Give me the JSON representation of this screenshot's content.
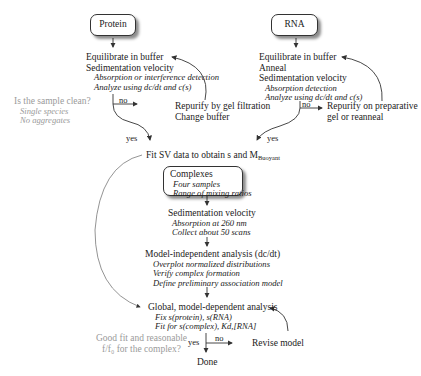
{
  "protein_box": {
    "label": "Protein"
  },
  "rna_box": {
    "label": "RNA"
  },
  "protein_steps": {
    "lines": [
      "Equilibrate in buffer",
      "Sedimentation velocity"
    ],
    "details": [
      "Absorption or interference detection",
      "Analyze using dc/dt and c(s)"
    ]
  },
  "rna_steps": {
    "lines": [
      "Equilibrate in buffer",
      "Anneal",
      "Sedimentation velocity"
    ],
    "details": [
      "Absorption detection",
      "Analyze using dc/dt and c(s)"
    ]
  },
  "clean_question": {
    "title": "Is the sample clean?",
    "details": [
      "Single species",
      "No aggregates"
    ]
  },
  "protein_repurify": {
    "lines": [
      "Repurify by gel filtration",
      "Change buffer"
    ]
  },
  "rna_repurify": {
    "lines": [
      "Repurify on preparative",
      "gel or reanneal"
    ]
  },
  "labels": {
    "no": "no",
    "yes": "yes"
  },
  "fit_sv": {
    "text": "Fit SV data to obtain s and M",
    "subscript": "Buoyant"
  },
  "complexes_box": {
    "title": "Complexes",
    "details": [
      "Four samples",
      "Range of mixing ratios"
    ]
  },
  "sv_step": {
    "title": "Sedimentation velocity",
    "details": [
      "Absorption at 260 nm",
      "Collect about 50 scans"
    ]
  },
  "model_independent": {
    "title": "Model-independent analysis (dc/dt)",
    "details": [
      "Overplot normalized distributions",
      "Verify complex formation",
      "Define preliminary association model"
    ]
  },
  "global_analysis": {
    "title": "Global, model-dependent analysis",
    "details": [
      "Fix s(protein), s(RNA)",
      "Fit for s(complex), Kd,[RNA]"
    ]
  },
  "fit_question": {
    "lines": [
      "Good fit and reasonable",
      "f/f₀ for the complex?"
    ]
  },
  "revise": {
    "text": "Revise model"
  },
  "done": {
    "text": "Done"
  },
  "colors": {
    "text": "#222222",
    "question": "#9a9a9a",
    "arrow": "#333333"
  }
}
